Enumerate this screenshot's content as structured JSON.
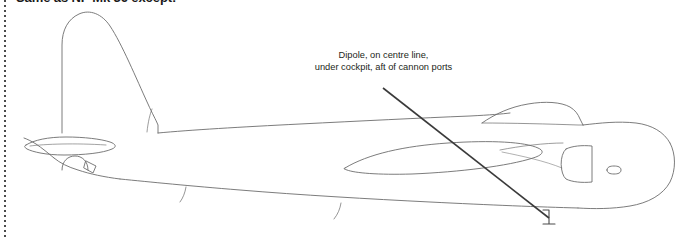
{
  "page": {
    "background_color": "#ffffff",
    "width": 683,
    "height": 238
  },
  "heading": {
    "text": "Same as NF Mk 36 except:",
    "color": "#1a1a1a",
    "clipped_top": true
  },
  "callout": {
    "line_1": "Dipole, on centre line,",
    "line_2": "under cockpit, aft of cannon ports",
    "color": "#231f20",
    "leader_line": {
      "from_x": 383,
      "from_y": 88,
      "to_x": 549,
      "to_y": 218,
      "color": "#3a3a3a"
    }
  },
  "left_rule": {
    "style": "dotted",
    "color": "#4a4a4a"
  },
  "drawing": {
    "subject": "aircraft-side-profile",
    "view": "port side elevation",
    "line_color": "#6d6d6d",
    "fill": "none",
    "parts": [
      "vertical-fin",
      "rudder",
      "fuselage",
      "tailplane",
      "tailwheel",
      "wing-root-fairing",
      "cockpit-canopy",
      "nose",
      "access-panel",
      "small-port",
      "dipole-antenna",
      "panel-lines"
    ]
  }
}
